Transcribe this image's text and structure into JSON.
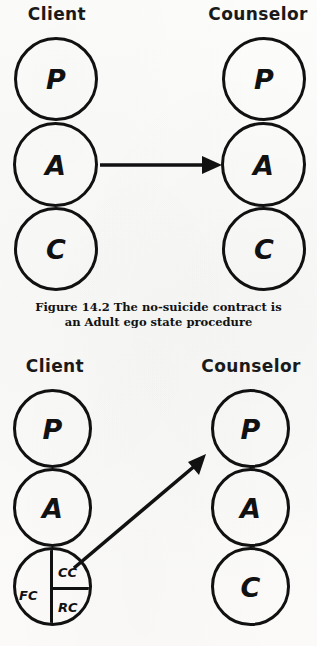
{
  "page": {
    "background_color": "#fbfbfa",
    "ink_color": "#111111"
  },
  "figures": [
    {
      "id": "figure-14-2",
      "columns": [
        {
          "role": "client",
          "label": "Client",
          "states": [
            {
              "code": "P",
              "name": "Parent"
            },
            {
              "code": "A",
              "name": "Adult"
            },
            {
              "code": "C",
              "name": "Child"
            }
          ]
        },
        {
          "role": "counselor",
          "label": "Counselor",
          "states": [
            {
              "code": "P",
              "name": "Parent"
            },
            {
              "code": "A",
              "name": "Adult"
            },
            {
              "code": "C",
              "name": "Child"
            }
          ]
        }
      ],
      "transaction": {
        "type": "complementary",
        "from": "client-adult",
        "to": "counselor-adult",
        "direction": "horizontal"
      },
      "caption": {
        "line1": "Figure 14.2 The no-suicide contract is",
        "line2": "an Adult ego state procedure"
      }
    },
    {
      "id": "figure-lower",
      "columns": [
        {
          "role": "client",
          "label": "Client",
          "states": [
            {
              "code": "P",
              "name": "Parent"
            },
            {
              "code": "A",
              "name": "Adult"
            },
            {
              "code": "C",
              "name": "Child",
              "subdivided": true,
              "subdivisions": [
                {
                  "code": "FC",
                  "name": "Free Child",
                  "position": "left"
                },
                {
                  "code": "CC",
                  "name": "Compliant Child",
                  "position": "top-right"
                },
                {
                  "code": "RC",
                  "name": "Rebellious Child",
                  "position": "bottom-right"
                }
              ]
            }
          ]
        },
        {
          "role": "counselor",
          "label": "Counselor",
          "states": [
            {
              "code": "P",
              "name": "Parent"
            },
            {
              "code": "A",
              "name": "Adult"
            },
            {
              "code": "C",
              "name": "Child"
            }
          ]
        }
      ],
      "transaction": {
        "type": "crossed",
        "from": "client-child",
        "to": "counselor-parent",
        "direction": "diagonal-up-right"
      }
    }
  ]
}
